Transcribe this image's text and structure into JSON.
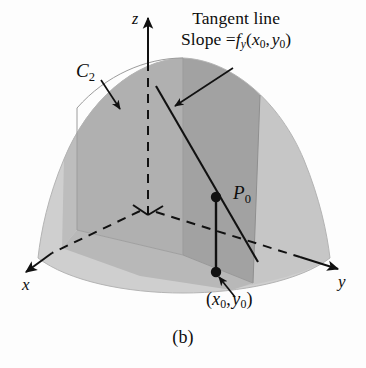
{
  "figure": {
    "caption": "(b)",
    "annotation": {
      "line1": "Tangent line",
      "line2_prefix": "Slope =",
      "function_symbol": "f",
      "function_subscript": "y",
      "arg_open": "(",
      "arg1_var": "x",
      "arg1_sub": "0",
      "arg_comma": ",",
      "arg2_var": "y",
      "arg2_sub": "0",
      "arg_close": ")",
      "full_text": "Slope = f_y(x_0, y_0)"
    },
    "labels": {
      "curve_c2_symbol": "C",
      "curve_c2_subscript": "2",
      "point_p0_symbol": "P",
      "point_p0_subscript": "0",
      "base_point_open": "(",
      "base_point_x": "x",
      "base_point_x_sub": "0",
      "base_point_comma": ",",
      "base_point_y": "y",
      "base_point_y_sub": "0",
      "base_point_close": ")",
      "base_point_full": "(x_0, y_0)"
    },
    "axes": {
      "x_label": "x",
      "y_label": "y",
      "z_label": "z"
    },
    "colors": {
      "surface_light": "#cfcfcf",
      "surface_mid": "#bcbcbc",
      "cut_plane_dark": "#a6a6a6",
      "cut_plane_darker": "#9a9a9a",
      "outline": "#111111",
      "background": "#fdfdfd",
      "ink": "#0d0d0d"
    }
  }
}
